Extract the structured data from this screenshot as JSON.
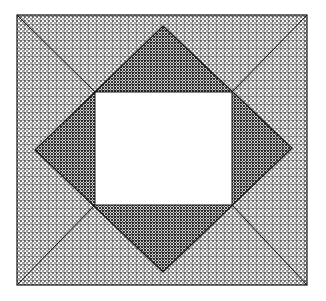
{
  "figure": {
    "canvas": {
      "width": 326,
      "height": 301,
      "background": "#ffffff"
    },
    "colors": {
      "background": "#ffffff",
      "ink": "#1a1a1a",
      "outline": "#141414",
      "texture_light": "#8a8a8a",
      "texture_dark": "#3a3a3a",
      "paper": "#ffffff"
    },
    "shapes": {
      "outer_rect": {
        "name": "outer-frame-rectangle",
        "x": 17,
        "y": 15,
        "width": 290,
        "height": 270,
        "stroke": "#141414",
        "stroke_width": 1.2,
        "fill": "none"
      },
      "diamond": {
        "name": "inscribed-diamond",
        "points": "163,26 292,148 163,272 35,150",
        "vertices": [
          {
            "label": "top",
            "x": 163,
            "y": 26
          },
          {
            "label": "right",
            "x": 292,
            "y": 148
          },
          {
            "label": "bottom",
            "x": 163,
            "y": 272
          },
          {
            "label": "left",
            "x": 35,
            "y": 150
          }
        ],
        "stroke": "#141414",
        "stroke_width": 1.2
      },
      "inner_square": {
        "name": "inner-white-square",
        "x": 95,
        "y": 92,
        "width": 137,
        "height": 113,
        "stroke": "#141414",
        "stroke_width": 1.0,
        "fill": "#ffffff"
      }
    },
    "regions": [
      {
        "id": "corner-top-left",
        "density": "light",
        "shading": "medium-grey crosshatch"
      },
      {
        "id": "corner-top-right",
        "density": "light",
        "shading": "medium-grey crosshatch"
      },
      {
        "id": "corner-bottom-left",
        "density": "light",
        "shading": "medium-grey crosshatch"
      },
      {
        "id": "corner-bottom-right",
        "density": "light",
        "shading": "medium-grey crosshatch"
      },
      {
        "id": "band-top",
        "density": "light",
        "shading": "medium-grey crosshatch"
      },
      {
        "id": "band-right",
        "density": "light",
        "shading": "medium-grey crosshatch"
      },
      {
        "id": "band-bottom",
        "density": "light",
        "shading": "medium-grey crosshatch"
      },
      {
        "id": "band-left",
        "density": "light",
        "shading": "medium-grey crosshatch"
      },
      {
        "id": "inner-triangle-top",
        "density": "dark",
        "shading": "dense dark crosshatch"
      },
      {
        "id": "inner-triangle-right",
        "density": "dark",
        "shading": "dense dark crosshatch"
      },
      {
        "id": "inner-triangle-bottom",
        "density": "dark",
        "shading": "dense dark crosshatch"
      },
      {
        "id": "inner-triangle-left",
        "density": "dark",
        "shading": "dense dark crosshatch"
      }
    ],
    "labels": []
  }
}
